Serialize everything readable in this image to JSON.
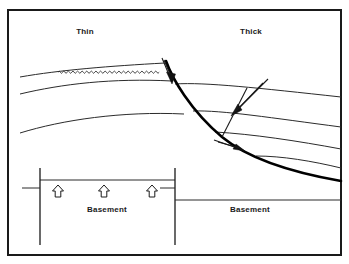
{
  "figure": {
    "type": "geological-cross-section",
    "background_color": "#ffffff",
    "frame_color": "#1a1a1a",
    "line_color": "#2b2b2b",
    "fault_color": "#000000"
  },
  "labels": {
    "thin": "Thin",
    "thick": "Thick",
    "basement_left": "Basement",
    "basement_right": "Basement"
  },
  "annotations": {
    "unconformity_name": "unconformity-wavy-line",
    "fault_name": "listric-normal-fault",
    "uplift_arrow_count": 3,
    "slip_arrow_count": 3,
    "horizon_count_left": 3,
    "horizon_count_right": 4
  },
  "geometry": {
    "frame": {
      "x": 8,
      "y": 10,
      "width": 333,
      "height": 245
    },
    "fault_main_path": "M 166 62 C 176 84, 196 116, 226 140 C 252 160, 292 172, 341 180",
    "horizons_left": [
      "M 20 77 C 60 70, 110 66, 166 63",
      "M 20 94 C 62 84, 112 79, 172 81",
      "M 20 133 C 62 120, 120 112, 182 113"
    ],
    "horizons_right": [
      "M 174 83 C 210 84, 260 89, 341 97",
      "M 191 110 C 220 111, 270 118, 341 126",
      "M 213 131 C 250 134, 296 141, 341 148",
      "M 255 155 C 280 156, 310 160, 341 167"
    ],
    "unconformity_span": {
      "x1": 58,
      "x2": 163,
      "amplitude": 2.0,
      "period": 4.6
    },
    "basement_left_top_y": 180,
    "basement_right_top_y": 200,
    "basement_left_fault_x": 40,
    "basement_right_fault_x": 175,
    "uplift_arrow_x": [
      58,
      104,
      152
    ],
    "uplift_arrow_y": 190
  }
}
